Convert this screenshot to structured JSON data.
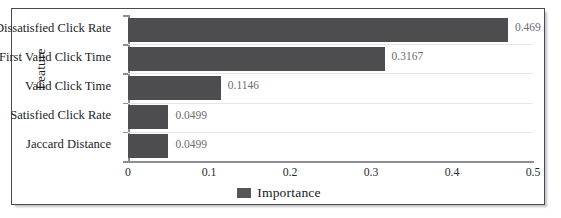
{
  "chart_data": {
    "type": "bar",
    "orientation": "horizontal",
    "title": "",
    "xlabel": "",
    "ylabel": "Feature",
    "xlim": [
      0,
      0.5
    ],
    "xticks": [
      "0",
      "0.1",
      "0.2",
      "0.3",
      "0.4",
      "0.5"
    ],
    "xtick_values": [
      0,
      0.1,
      0.2,
      0.3,
      0.4,
      0.5
    ],
    "grid": "horizontal",
    "legend": {
      "position": "bottom-center",
      "entries": [
        {
          "label": "Importance",
          "color": "#56565a"
        }
      ]
    },
    "categories": [
      "Dissatisfied Click Rate",
      "First Valid Click Time",
      "Valid Click Time",
      "Satisfied Click Rate",
      "Jaccard Distance"
    ],
    "series": [
      {
        "name": "Importance",
        "color": "#4d4d4f",
        "values": [
          0.469,
          0.3167,
          0.1146,
          0.0499,
          0.0499
        ],
        "value_labels": [
          "0.469",
          "0.3167",
          "0.1146",
          "0.0499",
          "0.0499"
        ]
      }
    ]
  },
  "colors": {
    "bar": "#4d4d4f",
    "legend_swatch": "#56565a",
    "gridline": "#e6e6e8",
    "axis": "#8d8d92",
    "value_text": "#6c6c70",
    "frame_border": "#4a4a50"
  }
}
